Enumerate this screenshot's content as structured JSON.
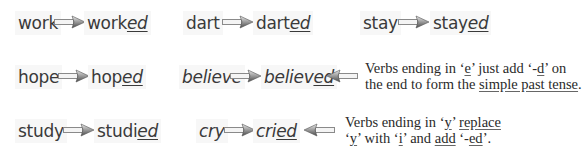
{
  "rows": [
    {
      "pairs": [
        {
          "base": "work",
          "stem": "work",
          "suffix": "ed"
        },
        {
          "base": "dart",
          "stem": "dart",
          "suffix": "ed"
        },
        {
          "base": "stay",
          "stem": "stay",
          "suffix": "ed"
        }
      ]
    },
    {
      "pairs": [
        {
          "base": "hope",
          "stem": "hop",
          "suffix": "ed"
        },
        {
          "base": "believe",
          "stem": "believ",
          "suffix": "ed"
        }
      ],
      "note": {
        "line1": {
          "t1": "Verbs ending in ‘",
          "e": "e",
          "t2": "’ just add ‘-",
          "d": "d",
          "t3": "’ on"
        },
        "line2": {
          "t1": "the end to form the ",
          "link": "simple past tense",
          "t2": "."
        }
      }
    },
    {
      "pairs": [
        {
          "base": "study",
          "stem": "studi",
          "suffix": "ed"
        },
        {
          "base": "cry",
          "stem": "cri",
          "suffix": "ed"
        }
      ],
      "note": {
        "line1": {
          "t1": "Verbs ending in ‘",
          "y": "y",
          "t2": "’ ",
          "replace": "replace"
        },
        "line2": {
          "t1": "‘",
          "y": "y",
          "t2": "’ with ‘",
          "i": "i",
          "t3": "’ and ",
          "add": "add",
          "t4": " ‘-",
          "ed": "ed",
          "t5": "’."
        }
      }
    }
  ],
  "icons": {
    "arrow_right": "arrow-right-icon",
    "arrow_left": "arrow-left-icon"
  }
}
